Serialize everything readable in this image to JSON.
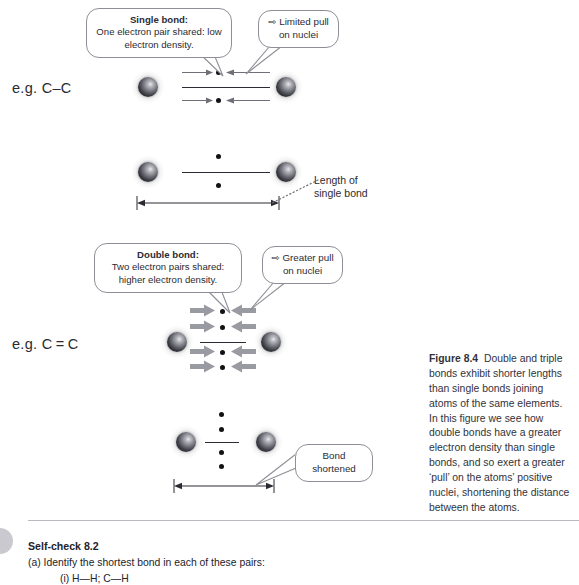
{
  "figure": {
    "callouts": {
      "single_bond_title": "Single bond:",
      "single_bond_body_1": "One electron pair shared: low",
      "single_bond_body_2": "electron density.",
      "limited_pull_icon": "⇨",
      "limited_pull_1": "Limited pull",
      "limited_pull_2": "on nuclei",
      "double_bond_title": "Double bond:",
      "double_bond_body_1": "Two electron pairs shared:",
      "double_bond_body_2": "higher electron density.",
      "greater_pull_icon": "⇨",
      "greater_pull_1": "Greater pull",
      "greater_pull_2": "on nuclei",
      "bond_shortened_1": "Bond",
      "bond_shortened_2": "shortened"
    },
    "examples": {
      "single": "e.g. C–C",
      "double": "e.g. C = C"
    },
    "annotations": {
      "length_of_1": "Length of",
      "length_of_2": "single bond"
    },
    "caption": {
      "label": "Figure 8.4",
      "text": "Double and triple bonds exhibit shorter lengths than single bonds joining atoms of the same elements. In this figure we see how double bonds have a greater electron density than single bonds, and so exert a greater ‘pull’ on the atoms’ positive nuclei, shortening the distance between the atoms."
    }
  },
  "selfcheck": {
    "title": "Self-check 8.2",
    "question_a": "(a)  Identify the shortest bond in each of these pairs:",
    "item_i": "(i)  H—H; C—H"
  },
  "colors": {
    "text": "#2b2b33",
    "bubble_border": "#8e8e96",
    "thin_arrow": "#6f6f78",
    "fat_arrow": "#9a9aa2",
    "rule": "#b9b9bf",
    "bullet": "#c9c9cf"
  }
}
